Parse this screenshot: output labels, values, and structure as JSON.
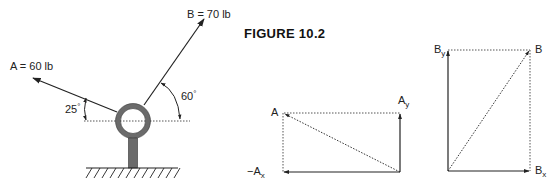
{
  "figure": {
    "title": "FIGURE 10.2"
  },
  "eyebolt_diagram": {
    "force_a": {
      "label": "A = 60 lb",
      "name": "A",
      "magnitude": 60,
      "unit": "lb",
      "angle_deg": 25,
      "angle_label": "25",
      "direction": "up-left"
    },
    "force_b": {
      "label": "B = 70 lb",
      "name": "B",
      "magnitude": 70,
      "unit": "lb",
      "angle_deg": 60,
      "angle_label": "60",
      "direction": "up-right"
    },
    "degree_symbol": "°"
  },
  "components_a": {
    "resultant_label": "A",
    "y_component": {
      "base": "A",
      "sub": "y"
    },
    "x_component": {
      "prefix": "−",
      "base": "A",
      "sub": "x"
    }
  },
  "components_b": {
    "resultant_label": "B",
    "y_component": {
      "base": "B",
      "sub": "y"
    },
    "x_component": {
      "base": "B",
      "sub": "x"
    }
  },
  "colors": {
    "line": "#222222",
    "ring": "#6b6b6b",
    "dotted": "#555555"
  }
}
